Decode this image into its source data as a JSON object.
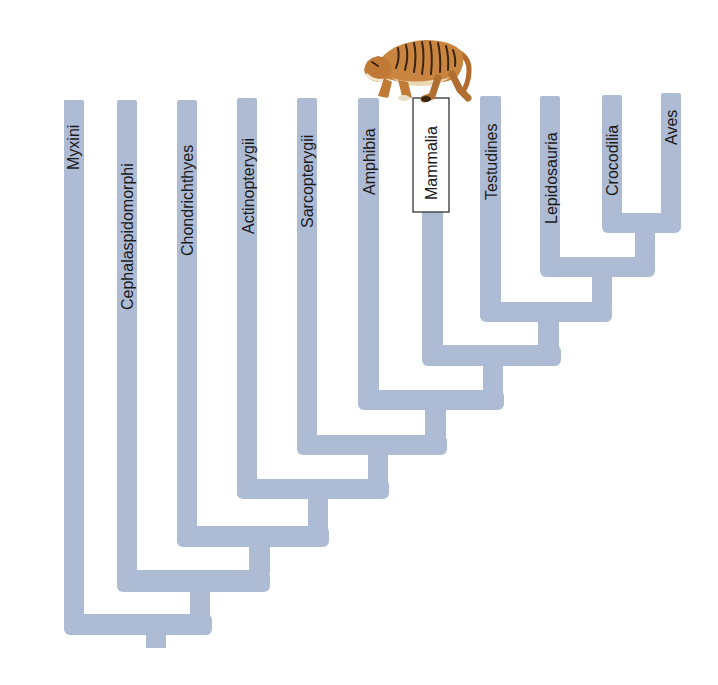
{
  "diagram": {
    "type": "cladogram",
    "orientation": "root-bottom",
    "branch_color": "#aebbd5",
    "highlighted_taxon": "Mammalia",
    "highlight_illustration": "tiger-icon",
    "taxa": [
      {
        "label": "Myxini"
      },
      {
        "label": "Cephalaspidomorphi"
      },
      {
        "label": "Chondrichthyes"
      },
      {
        "label": "Actinopterygii"
      },
      {
        "label": "Sarcopterygii"
      },
      {
        "label": "Amphibia"
      },
      {
        "label": "Mammalia"
      },
      {
        "label": "Testudines"
      },
      {
        "label": "Lepidosauria"
      },
      {
        "label": "Crocodilia"
      },
      {
        "label": "Aves"
      }
    ],
    "topology": "(Myxini,(Cephalaspidomorphi,(Chondrichthyes,(Actinopterygii,(Sarcopterygii,(Amphibia,(Mammalia,(Testudines,(Lepidosauria,(Crocodilia,Aves))))))))))"
  }
}
